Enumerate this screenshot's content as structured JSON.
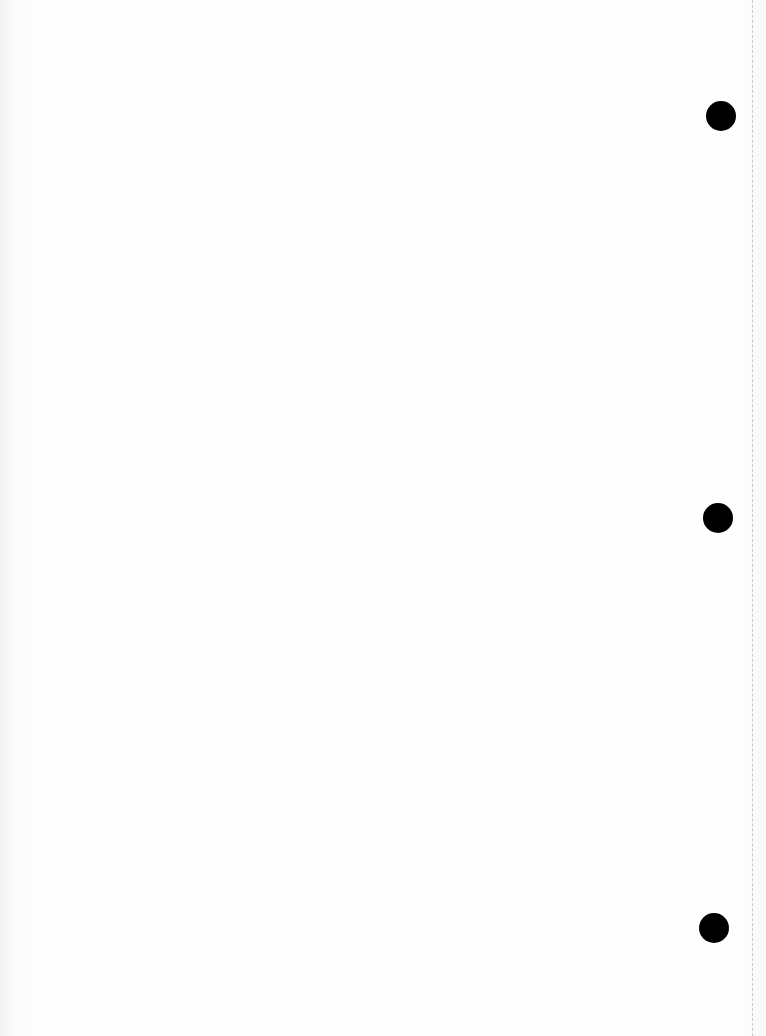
{
  "page": {
    "type": "scanned-blank-page",
    "background_color": "#fefefe",
    "binder_holes": [
      {
        "x": 721,
        "y": 116
      },
      {
        "x": 718,
        "y": 518
      },
      {
        "x": 714,
        "y": 928
      }
    ],
    "hole_color": "#000000",
    "edge_line_color": "#c8c8c8"
  }
}
